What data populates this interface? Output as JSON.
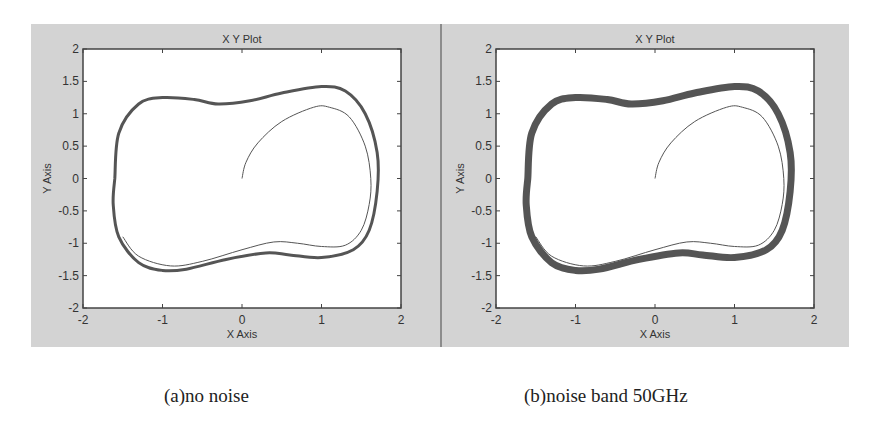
{
  "chart_data": [
    {
      "type": "line",
      "title": "X Y Plot",
      "xlabel": "X Axis",
      "ylabel": "Y Axis",
      "xlim": [
        -2,
        2
      ],
      "ylim": [
        -2,
        2
      ],
      "xticks": [
        "-2",
        "-1",
        "0",
        "1",
        "2"
      ],
      "yticks": [
        "2",
        "1.5",
        "1",
        "0.5",
        "0",
        "-0.5",
        "-1",
        "-1.5",
        "-2"
      ],
      "grid": false,
      "caption": "(a)no noise",
      "series": [
        {
          "name": "limit-cycle",
          "stroke_width": 3,
          "x": [
            -1.6,
            -1.55,
            -1.3,
            -1.0,
            -0.6,
            -0.3,
            0.1,
            0.5,
            1.0,
            1.3,
            1.55,
            1.7,
            1.7,
            1.6,
            1.4,
            1.0,
            0.6,
            0.3,
            -0.2,
            -0.7,
            -1.0,
            -1.3,
            -1.55,
            -1.62,
            -1.6
          ],
          "y": [
            0,
            0.7,
            1.15,
            1.25,
            1.22,
            1.15,
            1.2,
            1.32,
            1.42,
            1.35,
            1.0,
            0.4,
            -0.2,
            -0.8,
            -1.1,
            -1.22,
            -1.18,
            -1.15,
            -1.25,
            -1.4,
            -1.42,
            -1.3,
            -0.9,
            -0.4,
            0
          ]
        },
        {
          "name": "transient",
          "stroke_width": 1,
          "x": [
            0,
            0.05,
            0.2,
            0.5,
            0.9,
            1.1,
            1.35,
            1.55,
            1.62,
            1.6,
            1.5,
            1.3,
            1.0,
            0.7,
            0.4,
            0.0,
            -0.5,
            -0.9,
            -1.3,
            -1.5
          ],
          "y": [
            0,
            0.25,
            0.55,
            0.88,
            1.1,
            1.1,
            0.95,
            0.5,
            0,
            -0.4,
            -0.8,
            -1.03,
            -1.05,
            -1.0,
            -0.98,
            -1.1,
            -1.28,
            -1.35,
            -1.2,
            -0.9
          ]
        }
      ]
    },
    {
      "type": "line",
      "title": "X Y Plot",
      "xlabel": "X Axis",
      "ylabel": "Y Axis",
      "xlim": [
        -2,
        2
      ],
      "ylim": [
        -2,
        2
      ],
      "xticks": [
        "-2",
        "-1",
        "0",
        "1",
        "2"
      ],
      "yticks": [
        "2",
        "1.5",
        "1",
        "0.5",
        "0",
        "-0.5",
        "-1",
        "-1.5",
        "-2"
      ],
      "grid": false,
      "caption": "(b)noise band 50GHz",
      "series": [
        {
          "name": "limit-cycle-noisy",
          "stroke_width": 7,
          "x": [
            -1.6,
            -1.55,
            -1.3,
            -1.0,
            -0.6,
            -0.3,
            0.1,
            0.5,
            1.0,
            1.3,
            1.55,
            1.7,
            1.7,
            1.6,
            1.4,
            1.0,
            0.6,
            0.3,
            -0.2,
            -0.7,
            -1.0,
            -1.3,
            -1.55,
            -1.62,
            -1.6
          ],
          "y": [
            0,
            0.7,
            1.15,
            1.25,
            1.22,
            1.15,
            1.2,
            1.32,
            1.42,
            1.35,
            1.0,
            0.4,
            -0.2,
            -0.8,
            -1.1,
            -1.22,
            -1.18,
            -1.15,
            -1.25,
            -1.4,
            -1.42,
            -1.3,
            -0.9,
            -0.4,
            0
          ]
        },
        {
          "name": "transient",
          "stroke_width": 1,
          "x": [
            0,
            0.05,
            0.2,
            0.5,
            0.9,
            1.1,
            1.35,
            1.55,
            1.62,
            1.6,
            1.5,
            1.3,
            1.0,
            0.7,
            0.4,
            0.0,
            -0.5,
            -0.9,
            -1.3,
            -1.5
          ],
          "y": [
            0,
            0.25,
            0.55,
            0.88,
            1.1,
            1.1,
            0.95,
            0.5,
            0,
            -0.4,
            -0.8,
            -1.03,
            -1.05,
            -1.0,
            -0.98,
            -1.1,
            -1.28,
            -1.35,
            -1.2,
            -0.9
          ]
        }
      ]
    }
  ],
  "colors": {
    "panel_bg": "#d3d3d3",
    "axes_bg": "#ffffff",
    "curve": "#555555",
    "axis": "#444444"
  },
  "captions": {
    "a": "(a)no noise",
    "b": "(b)noise band 50GHz"
  }
}
